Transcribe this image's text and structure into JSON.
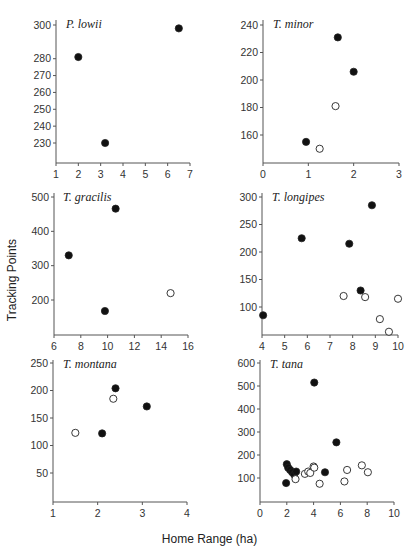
{
  "figure": {
    "ylabel": "Tracking Points",
    "xlabel": "Home Range (ha)",
    "legend_note": "filled circles and open circles denote two groups"
  },
  "chart_data": [
    {
      "type": "scatter",
      "title": "P. lowii",
      "xlabel": "Home Range (ha)",
      "ylabel": "Tracking Points",
      "xlim": [
        1,
        7
      ],
      "ylim": [
        220,
        300
      ],
      "xticks": [
        1,
        2,
        3,
        4,
        5,
        6,
        7
      ],
      "yticks": [
        230,
        240,
        250,
        260,
        270,
        280,
        300
      ],
      "ytick_labels": [
        "230",
        "240",
        "250",
        "260",
        "270",
        "280",
        "300"
      ],
      "grid": false,
      "series": [
        {
          "name": "filled",
          "marker": "filled",
          "points": [
            [
              2.0,
              281
            ],
            [
              3.2,
              230
            ],
            [
              6.5,
              298
            ]
          ]
        },
        {
          "name": "open",
          "marker": "open",
          "points": []
        }
      ]
    },
    {
      "type": "scatter",
      "title": "T. minor",
      "xlabel": "Home Range (ha)",
      "ylabel": "Tracking Points",
      "xlim": [
        0,
        3
      ],
      "ylim": [
        140,
        240
      ],
      "xticks": [
        0,
        1,
        2,
        3
      ],
      "yticks": [
        160,
        180,
        200,
        220,
        240
      ],
      "grid": false,
      "series": [
        {
          "name": "filled",
          "marker": "filled",
          "points": [
            [
              0.95,
              155
            ],
            [
              1.65,
              231
            ],
            [
              2.0,
              206
            ]
          ]
        },
        {
          "name": "open",
          "marker": "open",
          "points": [
            [
              1.25,
              150
            ],
            [
              1.6,
              181
            ]
          ]
        }
      ]
    },
    {
      "type": "scatter",
      "title": "T. gracilis",
      "xlabel": "Home Range (ha)",
      "ylabel": "Tracking Points",
      "xlim": [
        6,
        16
      ],
      "ylim": [
        100,
        500
      ],
      "xticks": [
        6,
        8,
        10,
        12,
        14,
        16
      ],
      "yticks": [
        200,
        300,
        400,
        500
      ],
      "grid": false,
      "series": [
        {
          "name": "filled",
          "marker": "filled",
          "points": [
            [
              7.1,
              330
            ],
            [
              9.8,
              168
            ],
            [
              10.6,
              466
            ]
          ]
        },
        {
          "name": "open",
          "marker": "open",
          "points": [
            [
              14.7,
              220
            ]
          ]
        }
      ]
    },
    {
      "type": "scatter",
      "title": "T. longipes",
      "xlabel": "Home Range (ha)",
      "ylabel": "Tracking Points",
      "xlim": [
        4,
        10
      ],
      "ylim": [
        50,
        300
      ],
      "xticks": [
        4,
        5,
        6,
        7,
        8,
        9,
        10
      ],
      "yticks": [
        100,
        150,
        200,
        250,
        300
      ],
      "grid": false,
      "series": [
        {
          "name": "filled",
          "marker": "filled",
          "points": [
            [
              4.05,
              85
            ],
            [
              5.75,
              225
            ],
            [
              7.85,
              215
            ],
            [
              8.35,
              130
            ],
            [
              8.85,
              285
            ]
          ]
        },
        {
          "name": "open",
          "marker": "open",
          "points": [
            [
              7.6,
              120
            ],
            [
              8.55,
              118
            ],
            [
              9.2,
              78
            ],
            [
              9.6,
              55
            ],
            [
              10.0,
              115
            ]
          ]
        }
      ]
    },
    {
      "type": "scatter",
      "title": "T. montana",
      "xlabel": "Home Range (ha)",
      "ylabel": "Tracking Points",
      "xlim": [
        1,
        4
      ],
      "ylim": [
        0,
        250
      ],
      "xticks": [
        1,
        2,
        3,
        4
      ],
      "yticks": [
        50,
        100,
        150,
        200,
        250
      ],
      "grid": false,
      "series": [
        {
          "name": "filled",
          "marker": "filled",
          "points": [
            [
              2.1,
              122
            ],
            [
              2.4,
              204
            ],
            [
              3.1,
              171
            ]
          ]
        },
        {
          "name": "open",
          "marker": "open",
          "points": [
            [
              1.5,
              123
            ],
            [
              2.35,
              185
            ]
          ]
        }
      ]
    },
    {
      "type": "scatter",
      "title": "T. tana",
      "xlabel": "Home Range (ha)",
      "ylabel": "Tracking Points",
      "xlim": [
        0,
        10
      ],
      "ylim": [
        0,
        600
      ],
      "xticks": [
        0,
        2,
        4,
        6,
        8,
        10
      ],
      "yticks": [
        100,
        200,
        300,
        400,
        500,
        600
      ],
      "grid": false,
      "series": [
        {
          "name": "filled",
          "marker": "filled",
          "points": [
            [
              1.95,
              78
            ],
            [
              2.0,
              160
            ],
            [
              2.1,
              145
            ],
            [
              2.25,
              135
            ],
            [
              2.4,
              125
            ],
            [
              2.55,
              115
            ],
            [
              2.7,
              128
            ],
            [
              4.05,
              515
            ],
            [
              4.85,
              125
            ],
            [
              5.7,
              255
            ]
          ]
        },
        {
          "name": "open",
          "marker": "open",
          "points": [
            [
              2.65,
              95
            ],
            [
              3.35,
              118
            ],
            [
              3.6,
              128
            ],
            [
              3.75,
              122
            ],
            [
              4.0,
              150
            ],
            [
              4.05,
              145
            ],
            [
              4.45,
              75
            ],
            [
              6.3,
              85
            ],
            [
              6.5,
              135
            ],
            [
              7.6,
              155
            ],
            [
              8.05,
              125
            ]
          ]
        }
      ]
    }
  ]
}
